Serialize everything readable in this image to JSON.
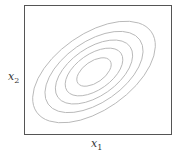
{
  "chart_data": {
    "type": "contour",
    "title": "",
    "xlabel": "x",
    "xlabel_sub": "1",
    "ylabel": "x",
    "ylabel_sub": "2",
    "center": [
      0,
      0
    ],
    "correlation": "positive",
    "rotation_deg": 35,
    "contour_levels": [
      1.0,
      0.8,
      0.63,
      0.47,
      0.28
    ],
    "grid": false,
    "ticks": false,
    "colors": {
      "contour": "#b8b8b8",
      "frame": "#555555"
    }
  }
}
